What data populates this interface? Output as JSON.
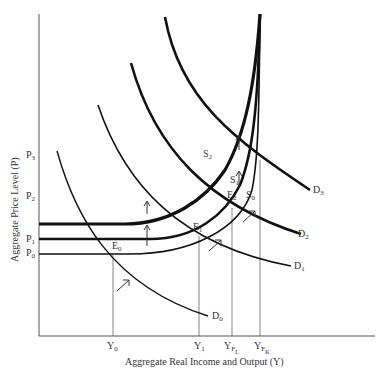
{
  "diagram": {
    "title": "",
    "x_axis_title": "Aggregate Real Income and Output (Y)",
    "y_axis_title": "Aggregate Price Level (P)",
    "y_ticks": [
      {
        "base": "P",
        "sub": "3"
      },
      {
        "base": "P",
        "sub": "2"
      },
      {
        "base": "P",
        "sub": "1"
      },
      {
        "base": "P",
        "sub": "0"
      }
    ],
    "x_ticks": [
      {
        "base": "Y",
        "sub": "0"
      },
      {
        "base": "Y",
        "sub": "1"
      },
      {
        "base": "Y",
        "sub": "F",
        "subsub": "L"
      },
      {
        "base": "Y",
        "sub": "F",
        "subsub": "K"
      }
    ],
    "demand_curves": [
      {
        "base": "D",
        "sub": "0"
      },
      {
        "base": "D",
        "sub": "1"
      },
      {
        "base": "D",
        "sub": "2"
      },
      {
        "base": "D",
        "sub": "3"
      }
    ],
    "supply_curves": [
      {
        "base": "S",
        "sub": "0"
      },
      {
        "base": "S",
        "sub": "1"
      },
      {
        "base": "S",
        "sub": "2"
      }
    ],
    "equilibria": [
      {
        "base": "E",
        "sub": "0"
      },
      {
        "base": "E",
        "sub": "1"
      },
      {
        "base": "E",
        "sub": "2"
      }
    ],
    "colors": {
      "line": "#111111",
      "text": "#333333",
      "guide": "#555555"
    }
  }
}
